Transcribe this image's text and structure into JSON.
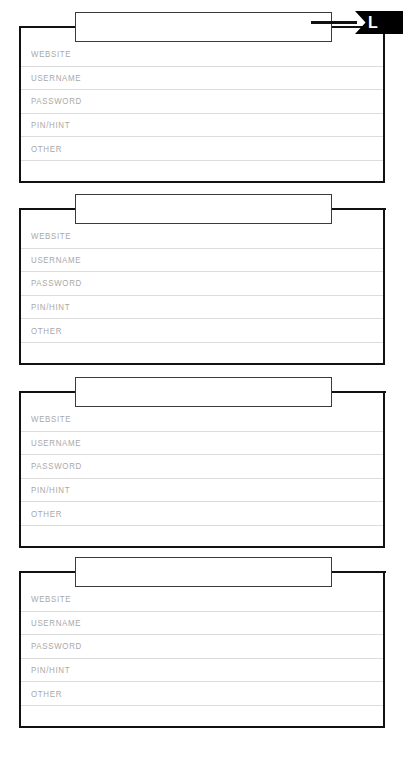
{
  "page": {
    "background_color": "#ffffff",
    "card_border_color": "#111111",
    "row_rule_color": "#dcdcdc",
    "label_color": "#a8a8a8",
    "ribbon_color": "#000000"
  },
  "index_tab": {
    "letter": "L",
    "name": "alphabet-index-tab"
  },
  "cards": [
    {
      "title": "",
      "title_placeholder": "",
      "rows": [
        {
          "label": "WEBSITE",
          "value": ""
        },
        {
          "label": "USERNAME",
          "value": ""
        },
        {
          "label": "PASSWORD",
          "value": ""
        },
        {
          "label": "PIN/HINT",
          "value": ""
        },
        {
          "label": "OTHER",
          "value": ""
        },
        {
          "label": "",
          "value": ""
        }
      ]
    },
    {
      "title": "",
      "title_placeholder": "",
      "rows": [
        {
          "label": "WEBSITE",
          "value": ""
        },
        {
          "label": "USERNAME",
          "value": ""
        },
        {
          "label": "PASSWORD",
          "value": ""
        },
        {
          "label": "PIN/HINT",
          "value": ""
        },
        {
          "label": "OTHER",
          "value": ""
        },
        {
          "label": "",
          "value": ""
        }
      ]
    },
    {
      "title": "",
      "title_placeholder": "",
      "rows": [
        {
          "label": "WEBSITE",
          "value": ""
        },
        {
          "label": "USERNAME",
          "value": ""
        },
        {
          "label": "PASSWORD",
          "value": ""
        },
        {
          "label": "PIN/HINT",
          "value": ""
        },
        {
          "label": "OTHER",
          "value": ""
        },
        {
          "label": "",
          "value": ""
        }
      ]
    },
    {
      "title": "",
      "title_placeholder": "",
      "rows": [
        {
          "label": "WEBSITE",
          "value": ""
        },
        {
          "label": "USERNAME",
          "value": ""
        },
        {
          "label": "PASSWORD",
          "value": ""
        },
        {
          "label": "PIN/HINT",
          "value": ""
        },
        {
          "label": "OTHER",
          "value": ""
        },
        {
          "label": "",
          "value": ""
        }
      ]
    }
  ]
}
